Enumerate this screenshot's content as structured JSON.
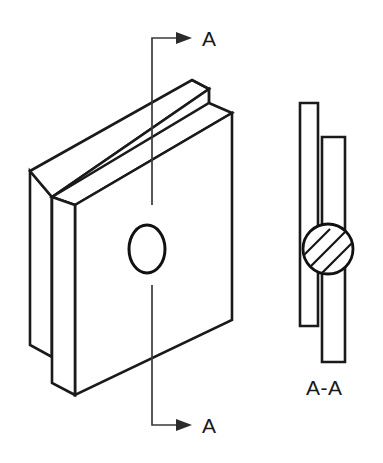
{
  "drawing": {
    "type": "isometric-engineering-drawing",
    "title": "Riveted plate assembly with section view",
    "background_color": "#ffffff",
    "line_color": "#1a1a1a",
    "fill_color": "#ffffff",
    "labels": {
      "section_arrow_top": "A",
      "section_arrow_bottom": "A",
      "section_view_title": "A-A"
    },
    "isometric_view": {
      "name": "isometric-plate-assembly",
      "description": "Two overlapping flat plates shown in isometric projection with a circular hole through the front plate",
      "front_plate": {
        "name": "front-plate",
        "hole": {
          "name": "through-hole",
          "shape": "ellipse",
          "center_x": 147,
          "center_y": 249,
          "radius_x": 18,
          "radius_y": 24
        }
      },
      "back_plate": {
        "name": "back-plate"
      }
    },
    "section_view": {
      "name": "section-view-a-a",
      "description": "Edge-on section A-A showing two offset plates joined by a hatched round rivet",
      "left_plate": {
        "name": "section-left-plate",
        "x": 300,
        "top_y": 103,
        "width": 18,
        "bottom_y": 326
      },
      "right_plate": {
        "name": "section-right-plate",
        "x": 322,
        "top_y": 137,
        "width": 23,
        "bottom_y": 362
      },
      "rivet": {
        "name": "rivet-hatched-circle",
        "center_x": 328,
        "center_y": 249,
        "radius": 25,
        "hatch_angle_degrees": 45,
        "hatch_line_count": 5
      }
    },
    "section_cut_line": {
      "name": "section-cut-line-a-a",
      "top_segment": {
        "x": 152,
        "y_start": 38,
        "y_end": 205
      },
      "bottom_segment": {
        "x": 152,
        "y_start": 285,
        "y_end": 425
      },
      "arrow_direction": "right"
    }
  }
}
